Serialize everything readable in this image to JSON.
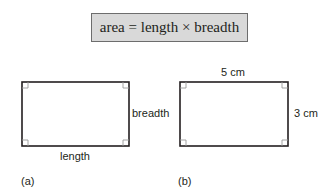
{
  "formula": "area = length × breadth",
  "figure_a": {
    "tag": "(a)",
    "bottom_label": "length",
    "right_label": "breadth"
  },
  "figure_b": {
    "tag": "(b)",
    "top_label": "5 cm",
    "right_label": "3 cm"
  },
  "colors": {
    "formula_bg": "#d9d9d9",
    "stroke": "#231f20",
    "right_angle": "#9a9a9a"
  }
}
